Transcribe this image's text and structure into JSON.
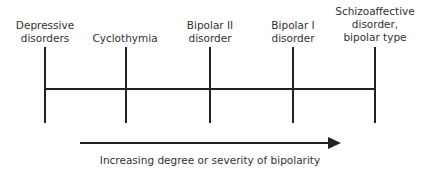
{
  "diagram": {
    "type": "spectrum",
    "categories": [
      {
        "lines": [
          "Depressive",
          "disorders"
        ],
        "x": 45
      },
      {
        "lines": [
          "Cyclothymia"
        ],
        "x": 125
      },
      {
        "lines": [
          "Bipolar II",
          "disorder"
        ],
        "x": 210
      },
      {
        "lines": [
          "Bipolar I",
          "disorder"
        ],
        "x": 293
      },
      {
        "lines": [
          "Schizoaffective",
          "disorder,",
          "bipolar type"
        ],
        "x": 375
      }
    ],
    "arrow_caption": "Increasing degree or severity of bipolarity",
    "line_color": "#222222"
  }
}
